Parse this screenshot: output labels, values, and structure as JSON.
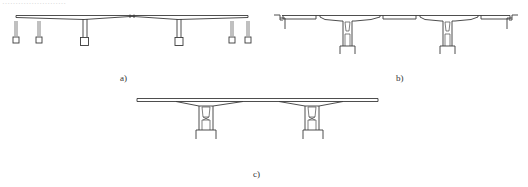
{
  "figure": {
    "header_fragment": "……………………",
    "panels": [
      {
        "id": "a",
        "label": "a)",
        "description": "Continuous girder with slender piers and pile foundations"
      },
      {
        "id": "b",
        "label": "b)",
        "description": "Simply supported spans on twin-column piers with abutments"
      },
      {
        "id": "c",
        "label": "c)",
        "description": "Continuous deck on twin-column piers"
      }
    ]
  },
  "colors": {
    "line": "#3a3a3a",
    "background": "#ffffff"
  }
}
